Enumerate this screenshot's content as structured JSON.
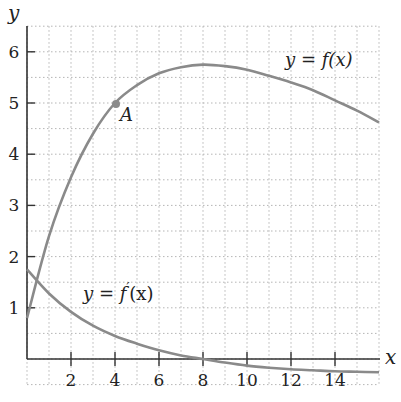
{
  "chart_data": {
    "type": "line",
    "title": "",
    "xlabel": "x",
    "ylabel": "y",
    "xlim": [
      0,
      16
    ],
    "ylim": [
      -0.5,
      6.5
    ],
    "grid": true,
    "x_ticks": [
      2,
      4,
      6,
      8,
      10,
      12,
      14
    ],
    "y_ticks": [
      1,
      2,
      3,
      4,
      5,
      6
    ],
    "series": [
      {
        "name": "y = f(x)",
        "x": [
          0,
          1,
          2,
          3,
          4,
          5,
          6,
          7,
          8,
          9,
          10,
          11,
          12,
          13,
          14,
          15,
          16
        ],
        "values": [
          0.8,
          2.4,
          3.55,
          4.4,
          5.0,
          5.35,
          5.58,
          5.7,
          5.75,
          5.72,
          5.65,
          5.53,
          5.4,
          5.25,
          5.05,
          4.85,
          4.62
        ]
      },
      {
        "name": "y = f'(x)",
        "x": [
          0,
          1,
          2,
          3,
          4,
          5,
          6,
          7,
          8,
          9,
          10,
          11,
          12,
          13,
          14,
          15,
          16
        ],
        "values": [
          1.75,
          1.28,
          0.92,
          0.65,
          0.45,
          0.3,
          0.17,
          0.07,
          0.0,
          -0.07,
          -0.13,
          -0.17,
          -0.2,
          -0.22,
          -0.24,
          -0.25,
          -0.26
        ]
      }
    ],
    "annotations": [
      {
        "label": "A",
        "x": 4,
        "y": 5
      },
      {
        "label": "y = f(x)",
        "x": 12,
        "y": 5.85
      },
      {
        "label": "y = f'(x)",
        "x": 3.5,
        "y": 1.2
      }
    ]
  },
  "labels": {
    "x_axis": "x",
    "y_axis": "y",
    "point_a": "A",
    "f_label_lhs": "y = ",
    "f_label_fn": "f(x)",
    "fp_label_lhs": "y = ",
    "fp_label_fn": "f",
    "fp_label_prime": "′",
    "fp_label_arg": "(x)",
    "xticks": [
      "2",
      "4",
      "6",
      "8",
      "10",
      "12",
      "14"
    ],
    "yticks": [
      "1",
      "2",
      "3",
      "4",
      "5",
      "6"
    ]
  },
  "colors": {
    "curve": "#8a8a8a",
    "axis": "#333333",
    "grid": "#b5b5b5"
  }
}
